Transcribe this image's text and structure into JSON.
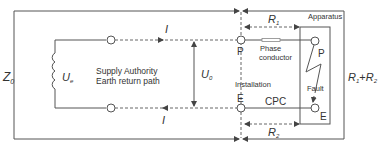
{
  "diagram": {
    "labels": {
      "z0": "Z",
      "z0_sub": "0",
      "ue": "U",
      "ue_sub": "e",
      "u0": "U",
      "u0_sub": "0",
      "supply_line1": "Supply Authority",
      "supply_line2": "Earth return path",
      "current_top": "I",
      "current_bottom": "I",
      "terminal_p_install": "P",
      "terminal_e_install": "E",
      "terminal_p_apparatus": "P",
      "terminal_e_apparatus": "E",
      "r1": "R",
      "r1_sub": "1",
      "r2": "R",
      "r2_sub": "2",
      "r1r2_a": "R",
      "r1r2_a_sub": "1",
      "r1r2_plus": "+",
      "r1r2_b": "R",
      "r1r2_b_sub": "2",
      "phase_line1": "Phase",
      "phase_line2": "conductor",
      "installation": "Installation",
      "cpc": "CPC",
      "apparatus": "Apparatus",
      "fault": "Fault"
    },
    "colors": {
      "line": "#555555",
      "text": "#333333",
      "background": "#ffffff"
    }
  }
}
